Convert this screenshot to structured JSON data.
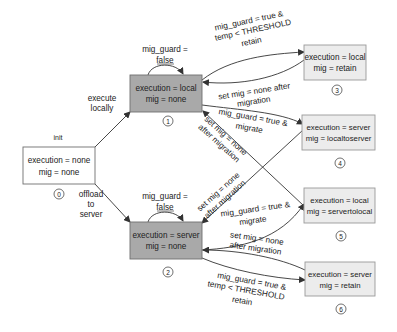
{
  "colors": {
    "state_dark": "#a9a9a9",
    "state_light": "#ececec",
    "state_init": "#ffffff",
    "border": "#6f6f6f",
    "edge": "#333333"
  },
  "states": [
    {
      "id": "0",
      "line1": "execution = none",
      "line2": "mig = none",
      "number": "0",
      "style": "init"
    },
    {
      "id": "1",
      "line1": "execution = local",
      "line2": "mig = none",
      "number": "1",
      "style": "dark"
    },
    {
      "id": "2",
      "line1": "execution = server",
      "line2": "mig = none",
      "number": "2",
      "style": "dark"
    },
    {
      "id": "3",
      "line1": "execution = local",
      "line2": "mig = retain",
      "number": "3",
      "style": "light"
    },
    {
      "id": "4",
      "line1": "execution = server",
      "line2": "mig = localtoserver",
      "number": "4",
      "style": "light"
    },
    {
      "id": "5",
      "line1": "execution = local",
      "line2": "mig = servertolocal",
      "number": "5",
      "style": "light"
    },
    {
      "id": "6",
      "line1": "execution = server",
      "line2": "mig = retain",
      "number": "6",
      "style": "light"
    }
  ],
  "labels": {
    "init": "init",
    "exec_local": [
      "execute",
      "locally"
    ],
    "offload": [
      "offload",
      "to",
      "server"
    ],
    "self_loop_1": [
      "mig_guard =",
      "false"
    ],
    "self_loop_2": [
      "mig_guard =",
      "false"
    ],
    "e_1_3": [
      "mig_guard = true &",
      "temp < THRESHOLD",
      "retain"
    ],
    "e_3_1": [
      "set mig = none after",
      "migration"
    ],
    "e_1_4": [
      "mig_guard = true &",
      "migrate"
    ],
    "e_5_1": [
      "set mig = none",
      "after migration"
    ],
    "e_4_2": [
      "set mig = none",
      "after migration"
    ],
    "e_2_5": [
      "mig_guard = true &",
      "migrate"
    ],
    "e_6_2": [
      "set mig = none",
      "after migration"
    ],
    "e_2_6": [
      "mig_guard = true &",
      "temp < THRESHOLD",
      "retain"
    ]
  }
}
